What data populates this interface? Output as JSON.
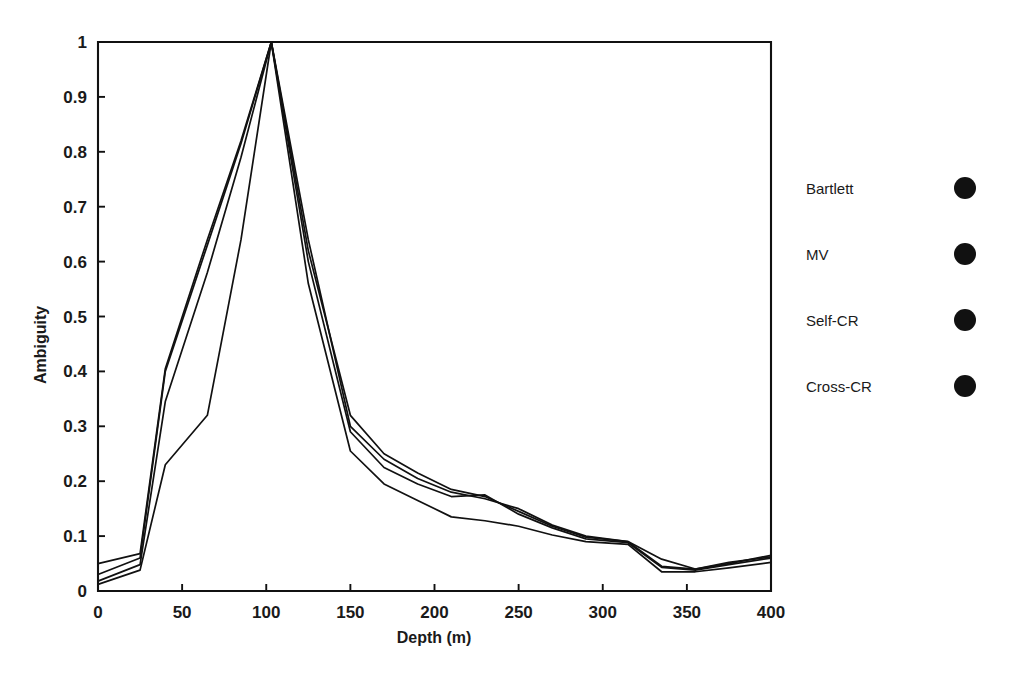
{
  "chart_data": {
    "type": "line",
    "title": "",
    "xlabel": "Depth (m)",
    "ylabel": "Ambiguity",
    "xlim": [
      0,
      400
    ],
    "ylim": [
      0,
      1
    ],
    "xticks": [
      0,
      50,
      100,
      150,
      200,
      250,
      300,
      350,
      400
    ],
    "xtick_labels": [
      "0",
      "50",
      "100",
      "150",
      "200",
      "250",
      "300",
      "350",
      "400"
    ],
    "yticks": [
      0,
      0.1,
      0.2,
      0.3,
      0.4,
      0.5,
      0.6,
      0.7,
      0.8,
      0.9,
      1
    ],
    "ytick_labels": [
      "0",
      "0.1",
      "0.2",
      "0.3",
      "0.4",
      "0.5",
      "0.6",
      "0.7",
      "0.8",
      "0.9",
      "1"
    ],
    "grid": false,
    "legend_position": "right-outside",
    "x": [
      0,
      25,
      40,
      65,
      85,
      103,
      125,
      150,
      170,
      190,
      210,
      230,
      250,
      270,
      290,
      315,
      335,
      355,
      375,
      400
    ],
    "series": [
      {
        "name": "Bartlett",
        "marker": "filled-circle",
        "color": "#111111",
        "values": [
          0.05,
          0.068,
          0.405,
          0.64,
          0.82,
          1.0,
          0.64,
          0.3,
          0.24,
          0.205,
          0.18,
          0.168,
          0.15,
          0.12,
          0.1,
          0.09,
          0.058,
          0.04,
          0.05,
          0.065
        ]
      },
      {
        "name": "MV",
        "marker": "filled-circle",
        "color": "#111111",
        "values": [
          0.03,
          0.06,
          0.4,
          0.63,
          0.815,
          1.0,
          0.62,
          0.32,
          0.25,
          0.215,
          0.185,
          0.172,
          0.145,
          0.118,
          0.098,
          0.09,
          0.045,
          0.04,
          0.052,
          0.062
        ]
      },
      {
        "name": "Self-CR",
        "marker": "filled-circle",
        "color": "#111111",
        "values": [
          0.018,
          0.048,
          0.345,
          0.58,
          0.79,
          1.0,
          0.6,
          0.29,
          0.225,
          0.195,
          0.172,
          0.175,
          0.14,
          0.115,
          0.095,
          0.088,
          0.043,
          0.038,
          0.048,
          0.06
        ]
      },
      {
        "name": "Cross-CR",
        "marker": "filled-circle",
        "color": "#111111",
        "values": [
          0.012,
          0.038,
          0.23,
          0.32,
          0.64,
          1.0,
          0.56,
          0.255,
          0.195,
          0.165,
          0.135,
          0.128,
          0.118,
          0.102,
          0.09,
          0.085,
          0.035,
          0.035,
          0.042,
          0.052
        ]
      }
    ]
  },
  "legend": {
    "entries": [
      {
        "label": "Bartlett"
      },
      {
        "label": "MV"
      },
      {
        "label": "Self-CR"
      },
      {
        "label": "Cross-CR"
      }
    ]
  }
}
